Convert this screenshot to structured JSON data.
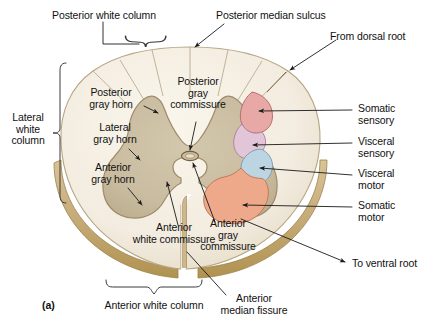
{
  "figure": {
    "panel_label": "(a)"
  },
  "colors": {
    "white_matter": "#f3ece0",
    "white_matter_edge": "#cbbb98",
    "gray_matter": "#c9bca0",
    "gray_matter_edge": "#9d8c6c",
    "rim_bevel": "#c8ad7c",
    "rim_bevel_dark": "#b59a67",
    "somatic_sensory": "#e8a9a6",
    "visceral_sensory": "#e3c5d8",
    "visceral_motor": "#bdd5e3",
    "somatic_motor": "#eda98a",
    "leader_line": "#1a1a1a",
    "brace": "#3a3a3a",
    "text": "#111111"
  },
  "labels": {
    "posterior_white_column": "Posterior white column",
    "posterior_median_sulcus": "Posterior median sulcus",
    "from_dorsal_root": "From dorsal root",
    "posterior_gray_horn": "Posterior\ngray horn",
    "posterior_gray_commissure": "Posterior\ngray\ncommissure",
    "lateral_gray_horn": "Lateral\ngray horn",
    "lateral_white_column": "Lateral\nwhite\ncolumn",
    "anterior_gray_horn": "Anterior\ngray horn",
    "anterior_white_commissure": "Anterior\nwhite commissure",
    "anterior_gray_commissure": "Anterior\ngray\ncommissure",
    "anterior_white_column": "Anterior white column",
    "anterior_median_fissure": "Anterior\nmedian fissure",
    "somatic_sensory": "Somatic\nsensory",
    "visceral_sensory": "Visceral\nsensory",
    "visceral_motor": "Visceral\nmotor",
    "somatic_motor": "Somatic\nmotor",
    "to_ventral_root": "To ventral root"
  },
  "nuclei": [
    {
      "name": "somatic-sensory",
      "label": "Somatic sensory",
      "color": "#e8a9a6"
    },
    {
      "name": "visceral-sensory",
      "label": "Visceral sensory",
      "color": "#e3c5d8"
    },
    {
      "name": "visceral-motor",
      "label": "Visceral motor",
      "color": "#bdd5e3"
    },
    {
      "name": "somatic-motor",
      "label": "Somatic motor",
      "color": "#eda98a"
    }
  ]
}
